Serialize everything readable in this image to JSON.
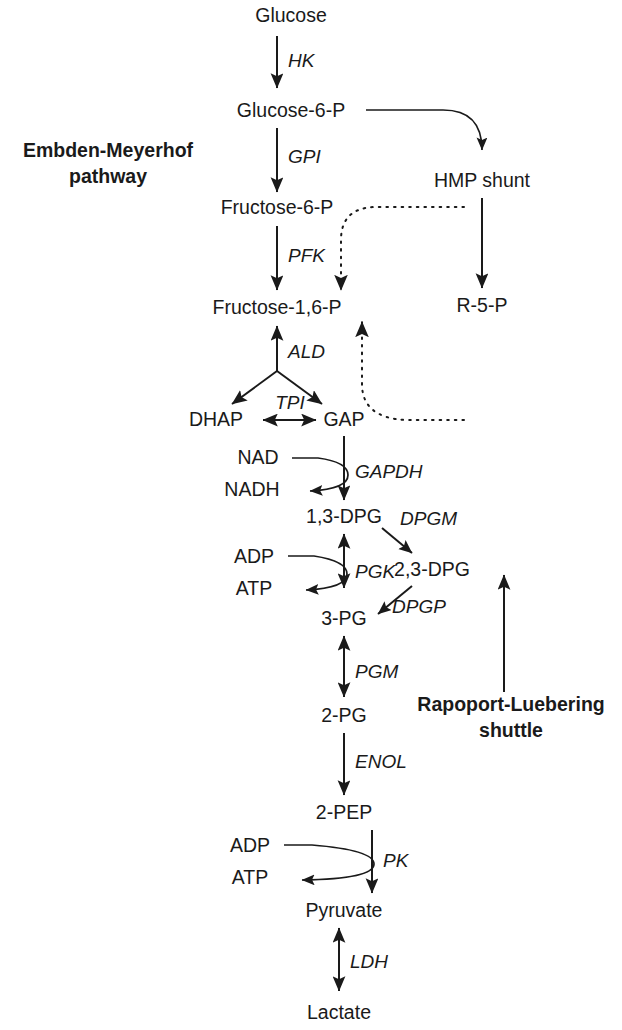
{
  "figure": {
    "pathway_labels": {
      "left_line1": "Embden-Meyerhof",
      "left_line2": "pathway",
      "right_line1": "Rapoport-Luebering",
      "right_line2": "shuttle"
    }
  },
  "metabolites": {
    "glucose": "Glucose",
    "glucose_6_p": "Glucose-6-P",
    "fructose_6_p": "Fructose-6-P",
    "fructose_16_p": "Fructose-1,6-P",
    "dhap": "DHAP",
    "gap": "GAP",
    "dpg_13": "1,3-DPG",
    "dpg_23": "2,3-DPG",
    "pg_3": "3-PG",
    "pg_2": "2-PG",
    "pep_2": "2-PEP",
    "pyruvate": "Pyruvate",
    "lactate": "Lactate",
    "hmp_shunt": "HMP shunt",
    "r_5_p": "R-5-P"
  },
  "cofactors": {
    "nad": "NAD",
    "nadh": "NADH",
    "adp_1": "ADP",
    "atp_1": "ATP",
    "adp_2": "ADP",
    "atp_2": "ATP"
  },
  "enzymes": {
    "hk": "HK",
    "gpi": "GPI",
    "pfk": "PFK",
    "ald": "ALD",
    "tpi": "TPI",
    "gapdh": "GAPDH",
    "pgk": "PGK",
    "dpgm": "DPGM",
    "dpgp": "DPGP",
    "pgm": "PGM",
    "enol": "ENOL",
    "pk": "PK",
    "ldh": "LDH"
  },
  "colors": {
    "text": "#1a1a1a",
    "stroke": "#1a1a1a",
    "background": "#ffffff"
  }
}
